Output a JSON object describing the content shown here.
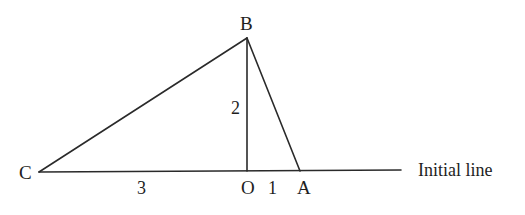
{
  "figure": {
    "vertices": {
      "B": {
        "label": "B"
      },
      "C": {
        "label": "C"
      },
      "O": {
        "label": "O"
      },
      "A": {
        "label": "A"
      }
    },
    "lengths": {
      "OB": "2",
      "CO": "3",
      "OA": "1"
    },
    "initial_line_label": "Initial line",
    "segments": [
      "C-B",
      "B-O",
      "B-A",
      "C-A",
      "A-initial-line-end"
    ]
  }
}
